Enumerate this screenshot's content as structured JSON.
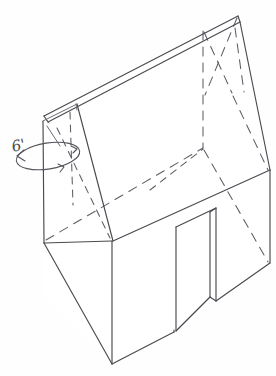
{
  "drawing": {
    "title": "Pictorial sketch of a gable-roof structure with door opening",
    "medium": "pencil on white paper",
    "line_color": "#4a4a50",
    "hidden_line_color": "#5d5d66",
    "background_color": "#fefefe",
    "view_type": "pictorial / oblique isometric"
  },
  "annotations": [
    {
      "id": "height-dimension",
      "label": "6'",
      "value": 6,
      "unit": "feet",
      "leader_type": "wrap-around ellipse with double arrowheads",
      "position": "left gable end wall",
      "x": 14,
      "y": 152
    }
  ],
  "geometry": {
    "roof": {
      "name": "sloping shed roof",
      "ridge_peak": {
        "x": 238,
        "y": 17
      },
      "ridge_low": {
        "x": 45,
        "y": 116
      },
      "fascia_thickness_px": 5,
      "right_eave": {
        "x": 270,
        "y": 170
      },
      "left_eave": {
        "x": 43,
        "y": 122
      }
    },
    "walls": {
      "front_face_bottom": {
        "x": 112,
        "y": 364
      },
      "left_face_bottom": {
        "x": 44,
        "y": 243
      },
      "right_corner_bottom": {
        "x": 270,
        "y": 263
      },
      "front_corner_top": {
        "x": 112,
        "y": 241
      }
    },
    "door": {
      "name": "door opening",
      "top_left": {
        "x": 176,
        "y": 227
      },
      "top_right": {
        "x": 216,
        "y": 208
      },
      "bottom_left": {
        "x": 176,
        "y": 331
      },
      "bottom_right": {
        "x": 216,
        "y": 300
      },
      "has_visible_jamb_thickness": true
    },
    "hidden_edges_count": 7,
    "visible_faces": [
      "left gable end",
      "front slope roof",
      "front wall",
      "right side wall"
    ]
  },
  "labels": {
    "canvas_name": "sketch-canvas",
    "figure_caption": ""
  }
}
